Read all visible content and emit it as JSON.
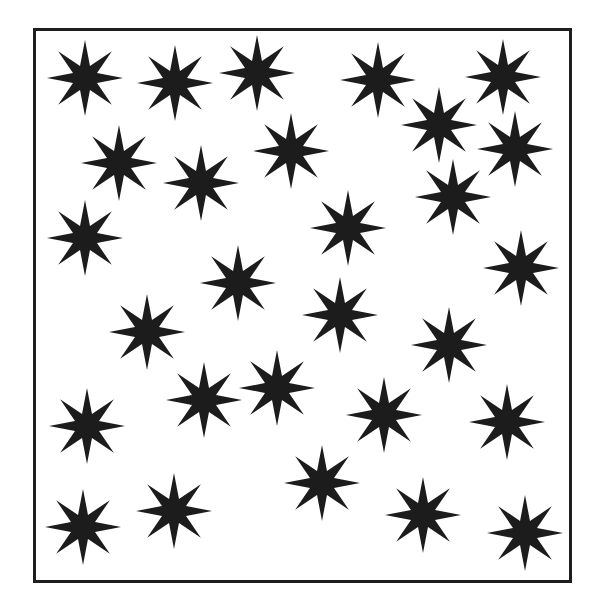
{
  "figure": {
    "width": 602,
    "height": 613,
    "background": "#ffffff",
    "frame": {
      "x": 33,
      "y": 28,
      "width": 539,
      "height": 555,
      "stroke": "#1e1e1e",
      "stroke_width": 3
    },
    "star_style": {
      "points": 8,
      "outer_radius": 38,
      "inner_radius": 13,
      "fill": "#1c1c1c"
    },
    "star_count": 28,
    "stars": [
      {
        "x": 85,
        "y": 78,
        "rot": 0
      },
      {
        "x": 175,
        "y": 83,
        "rot": 0
      },
      {
        "x": 257,
        "y": 73,
        "rot": 0
      },
      {
        "x": 378,
        "y": 80,
        "rot": 0
      },
      {
        "x": 503,
        "y": 77,
        "rot": 0
      },
      {
        "x": 439,
        "y": 125,
        "rot": 0
      },
      {
        "x": 119,
        "y": 163,
        "rot": 0
      },
      {
        "x": 201,
        "y": 183,
        "rot": 0
      },
      {
        "x": 291,
        "y": 151,
        "rot": 0
      },
      {
        "x": 515,
        "y": 149,
        "rot": 0
      },
      {
        "x": 453,
        "y": 197,
        "rot": 0
      },
      {
        "x": 85,
        "y": 238,
        "rot": 0
      },
      {
        "x": 348,
        "y": 228,
        "rot": 0
      },
      {
        "x": 521,
        "y": 268,
        "rot": 0
      },
      {
        "x": 238,
        "y": 283,
        "rot": 0
      },
      {
        "x": 340,
        "y": 315,
        "rot": 0
      },
      {
        "x": 147,
        "y": 332,
        "rot": 0
      },
      {
        "x": 449,
        "y": 345,
        "rot": 0
      },
      {
        "x": 204,
        "y": 400,
        "rot": 0
      },
      {
        "x": 277,
        "y": 388,
        "rot": 0
      },
      {
        "x": 384,
        "y": 415,
        "rot": 0
      },
      {
        "x": 87,
        "y": 426,
        "rot": 0
      },
      {
        "x": 507,
        "y": 422,
        "rot": 0
      },
      {
        "x": 322,
        "y": 483,
        "rot": 0
      },
      {
        "x": 83,
        "y": 527,
        "rot": 0
      },
      {
        "x": 174,
        "y": 511,
        "rot": 0
      },
      {
        "x": 423,
        "y": 515,
        "rot": 0
      },
      {
        "x": 525,
        "y": 533,
        "rot": 0
      }
    ]
  }
}
